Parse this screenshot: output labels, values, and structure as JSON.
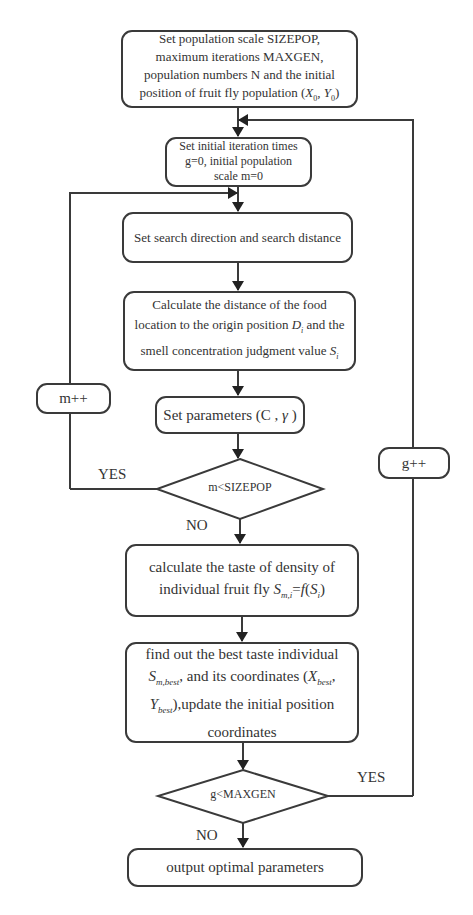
{
  "flowchart": {
    "start": {
      "line1": "Set population scale SIZEPOP,",
      "line2": "maximum iterations MAXGEN,",
      "line3": "population numbers N and the initial",
      "line4_prefix": "position of fruit fly population (",
      "x0": "X",
      "x0_sub": "0",
      "sep": ", ",
      "y0": "Y",
      "y0_sub": "0",
      "suffix": ")"
    },
    "init": {
      "line1": "Set initial iteration times",
      "line2": "g=0,  initial population",
      "line3": "scale m=0"
    },
    "search": {
      "text": "Set search direction and search distance"
    },
    "calculate": {
      "line1": "Calculate the distance of the food",
      "line2_prefix": "location to the origin position ",
      "d": "D",
      "d_sub": "i",
      "line2_suffix": " and the",
      "line3_prefix": "smell concentration judgment value ",
      "s": "S",
      "s_sub": "i"
    },
    "params": {
      "prefix": "Set parameters (C , ",
      "gamma": "γ",
      "suffix": " )"
    },
    "decision1": {
      "text": "m<SIZEPOP",
      "yes": "YES",
      "no": "NO"
    },
    "increment_m": {
      "text": "m++"
    },
    "taste": {
      "line1": "calculate the taste of density of",
      "line2_prefix": "individual fruit fly ",
      "s": "S",
      "s_sub": "m,i",
      "eq": "=",
      "f": "f",
      "open": "(",
      "si": "S",
      "si_sub": "i",
      "close": ")"
    },
    "best": {
      "line1": "find out the best taste  individual",
      "s": "S",
      "s_sub": "m,best",
      "line2_mid": ", and its coordinates  (",
      "x": "X",
      "x_sub": "best",
      "comma": ",",
      "y": "Y",
      "y_sub": "best",
      "line3_suffix": "),update the  initial position",
      "line4": "coordinates"
    },
    "decision2": {
      "text": "g<MAXGEN",
      "yes": "YES",
      "no": "NO"
    },
    "increment_g": {
      "text": "g++"
    },
    "end": {
      "text": "output optimal  parameters"
    }
  }
}
